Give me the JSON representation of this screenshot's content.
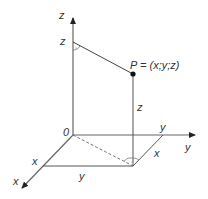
{
  "diagram": {
    "colors": {
      "axis": "#555555",
      "line": "#444444",
      "point": "#111111",
      "text": "#333333",
      "background": "#ffffff"
    },
    "axes": {
      "z": {
        "label": "z"
      },
      "y": {
        "label": "y"
      },
      "x": {
        "label": "x"
      },
      "origin": {
        "label": "0"
      }
    },
    "point": {
      "label": "P = (x;y;z)"
    },
    "coordinate_labels": {
      "z_on_axis": "z",
      "z_vertical": "z",
      "y_on_axis": "y",
      "x_projection": "x",
      "x_on_axis": "x",
      "y_projection": "y"
    }
  }
}
